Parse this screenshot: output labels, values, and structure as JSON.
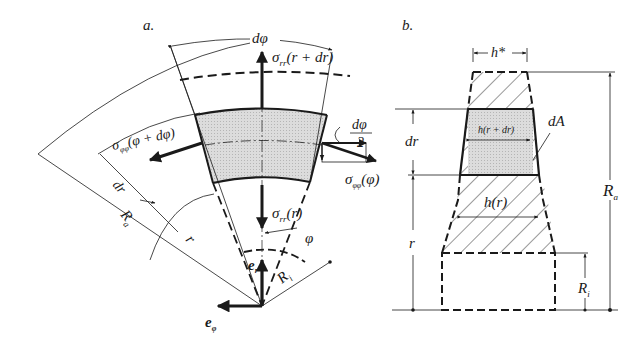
{
  "panels": {
    "a": {
      "label": "a.",
      "labels": {
        "dphi": "dφ",
        "sigma_rr_top": "σ",
        "sigma_rr_top_sub": "rr",
        "sigma_rr_top_arg": "(r + dr)",
        "sigma_pp_left": "σ",
        "sigma_pp_left_sub": "φφ",
        "sigma_pp_left_arg": "(φ + dφ)",
        "dphi_half_num": "dφ",
        "dphi_half_den": "2",
        "sigma_pp_right": "σ",
        "sigma_pp_right_sub": "φφ",
        "sigma_pp_right_arg": "(φ)",
        "sigma_rr_bot": "σ",
        "sigma_rr_bot_sub": "rr",
        "sigma_rr_bot_arg": "(r)",
        "dr": "dr",
        "Ra": "R",
        "Ra_sub": "a",
        "r": "r",
        "phi": "φ",
        "er": "e",
        "er_sub": "r",
        "Ri": "R",
        "Ri_sub": "i",
        "ephi": "e",
        "ephi_sub": "φ"
      }
    },
    "b": {
      "label": "b.",
      "labels": {
        "h_star": "h*",
        "dA": "dA",
        "h_r_dr": "h(r + dr)",
        "dr": "dr",
        "h_r": "h(r)",
        "r": "r",
        "Ra": "R",
        "Ra_sub": "a",
        "Ri": "R",
        "Ri_sub": "i"
      }
    }
  },
  "colors": {
    "ink": "#1a1a1a",
    "element_fill": "#d9d9d9"
  }
}
